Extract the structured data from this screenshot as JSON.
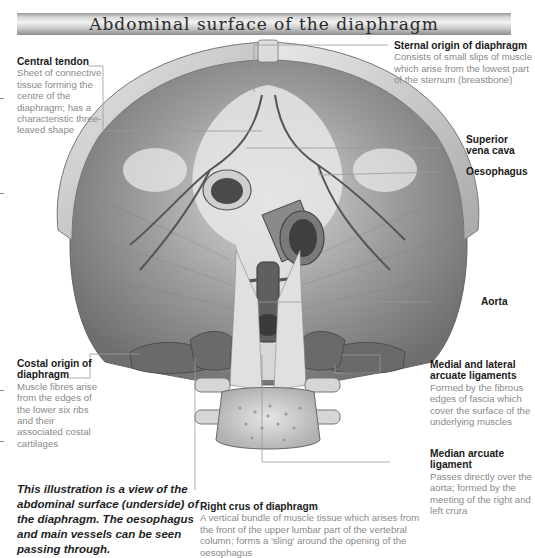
{
  "title": "Abdominal surface of the diaphragm",
  "labels": {
    "central_tendon": {
      "head": "Central tendon",
      "body": "Sheet of connective tissue forming the centre of the diaphragm; has a characteristic three-leaved shape"
    },
    "sternal_origin": {
      "head": "Sternal origin of diaphragm",
      "body": "Consists of small slips of muscle which arise from the lowest part of the sternum (breastbone)"
    },
    "superior_vena_cava": {
      "head": "Superior vena cava"
    },
    "oesophagus": {
      "head": "Oesophagus"
    },
    "aorta": {
      "head": "Aorta"
    },
    "costal_origin": {
      "head": "Costal origin of diaphragm",
      "body": "Muscle fibres arise from the edges of the lower six ribs and their associated costal cartilages"
    },
    "arcuate_ligaments": {
      "head": "Medial and lateral arcuate ligaments",
      "body": "Formed by the fibrous edges of fascia which cover the surface of the underlying muscles"
    },
    "median_arcuate": {
      "head": "Median arcuate ligament",
      "body": "Passes directly over the aorta; formed by the meeting of the right and left crura"
    },
    "right_crus": {
      "head": "Right crus of diaphragm",
      "body": "A vertical bundle of muscle tissue which arises from the front of the upper lumbar part of the vertebral column; forms a 'sling' around the opening of the oesophagus"
    }
  },
  "caption": "This illustration is a view of the abdominal surface (underside) of the diaphragm. The oesophagus and main vessels can be seen passing through.",
  "colors": {
    "muscle": "#8c8c8c",
    "tendon": "#e4e4e4",
    "vessel": "#5a5a5a",
    "leader_line": "#9a9a9a"
  }
}
